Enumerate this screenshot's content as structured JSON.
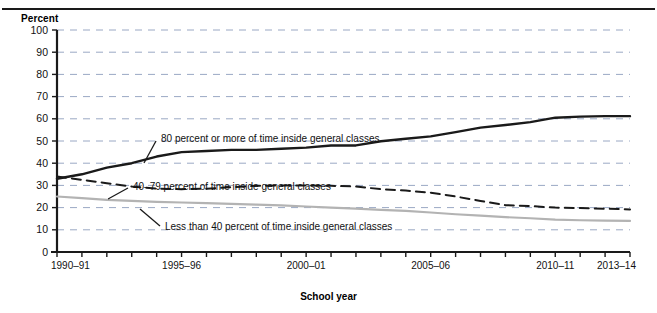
{
  "figure": {
    "yaxis_title": "Percent",
    "xaxis_title": "School year"
  },
  "annotations": {
    "series1": "80 percent or more of time inside general classes",
    "series2": "40–79 percent of time inside general classes",
    "series3": "Less than 40 percent of time inside general classes"
  },
  "colors": {
    "series1": "#1a1a1a",
    "series2": "#1a1a1a",
    "series3": "#b3b3b3",
    "grid": "#9aa8c4",
    "axis": "#1a1a1a"
  },
  "chart_data": {
    "type": "line",
    "title": "",
    "subtitle": "",
    "xlabel": "School year",
    "ylabel": "Percent",
    "ylim": [
      0,
      100
    ],
    "ytick_labels": [
      "0",
      "10",
      "20",
      "30",
      "40",
      "50",
      "60",
      "70",
      "80",
      "90",
      "100"
    ],
    "ytick_values": [
      0,
      10,
      20,
      30,
      40,
      50,
      60,
      70,
      80,
      90,
      100
    ],
    "grid": true,
    "grid_axis": "y",
    "legend_position": "inline-annotations",
    "x": [
      "1990–91",
      "1991–92",
      "1992–93",
      "1993–94",
      "1994–95",
      "1995–96",
      "1996–97",
      "1997–98",
      "1998–99",
      "1999–2000",
      "2000–01",
      "2001–02",
      "2002–03",
      "2003–04",
      "2004–05",
      "2005–06",
      "2006–07",
      "2007–08",
      "2008–09",
      "2009–10",
      "2010–11",
      "2011–12",
      "2012–13",
      "2013–14"
    ],
    "xtick_labels": [
      "1990–91",
      "1995–96",
      "2000–01",
      "2005–06",
      "2010–11",
      "2013–14"
    ],
    "xtick_indices": [
      0,
      5,
      10,
      15,
      20,
      23
    ],
    "series": [
      {
        "name": "80 percent or more of time inside general classes",
        "style": "solid",
        "color": "#1a1a1a",
        "values": [
          33,
          35,
          38,
          40,
          43,
          45,
          45.5,
          46,
          46,
          46.5,
          47,
          48,
          48,
          49.9,
          51,
          52.1,
          54,
          56,
          57.2,
          58.5,
          60.5,
          61,
          61.2,
          61.2
        ]
      },
      {
        "name": "40–79 percent of time inside general classes",
        "style": "dashed",
        "color": "#1a1a1a",
        "values": [
          34,
          32.5,
          31,
          29.5,
          28.5,
          28.3,
          28.5,
          29.2,
          29.8,
          30,
          30,
          29.8,
          29.5,
          28.3,
          27.7,
          26.7,
          25,
          23,
          21.1,
          20.7,
          20,
          19.8,
          19.5,
          19.2
        ]
      },
      {
        "name": "Less than 40 percent of time inside general classes",
        "style": "solid",
        "color": "#b3b3b3",
        "values": [
          25,
          24.3,
          23.5,
          23,
          22.6,
          22.3,
          22,
          21.7,
          21.3,
          21,
          20.5,
          20,
          19.5,
          19,
          18.5,
          17.8,
          17,
          16.4,
          15.7,
          15.2,
          14.6,
          14.3,
          14.1,
          14
        ]
      }
    ]
  }
}
